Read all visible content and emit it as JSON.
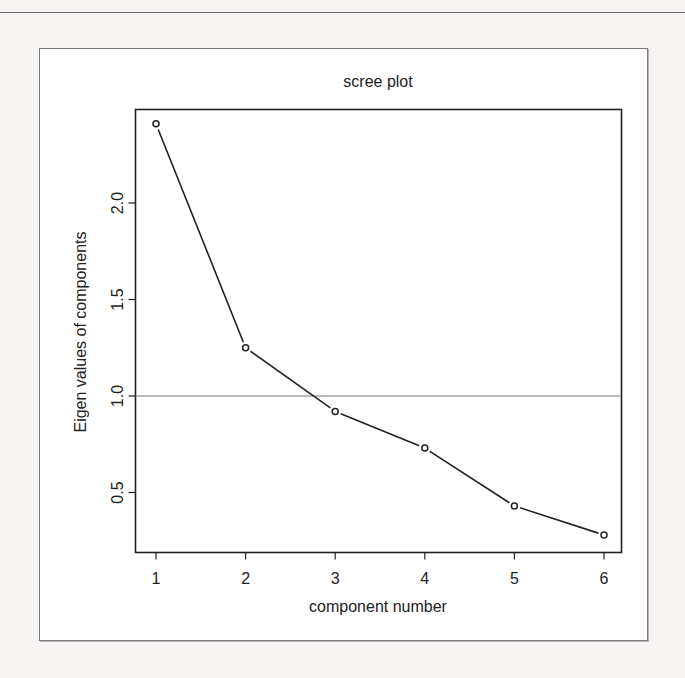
{
  "chart_data": {
    "type": "line",
    "title": "scree plot",
    "xlabel": "component number",
    "ylabel": "Eigen values of components",
    "x": [
      1,
      2,
      3,
      4,
      5,
      6
    ],
    "values": [
      2.41,
      1.25,
      0.92,
      0.73,
      0.43,
      0.28
    ],
    "series": [
      {
        "name": "eigenvalues",
        "values": [
          2.41,
          1.25,
          0.92,
          0.73,
          0.43,
          0.28
        ]
      }
    ],
    "xticks": [
      "1",
      "2",
      "3",
      "4",
      "5",
      "6"
    ],
    "yticks": [
      "0.5",
      "1.0",
      "1.5",
      "2.0"
    ],
    "ytick_values": [
      0.5,
      1.0,
      1.5,
      2.0
    ],
    "reference_line": {
      "y": 1.0,
      "orientation": "horizontal"
    },
    "marker": "open-circle",
    "xlim": [
      0.9,
      6.15
    ],
    "ylim": [
      0.2,
      2.5
    ],
    "grid": false,
    "legend": null
  },
  "colors": {
    "background": "#f8f3f3",
    "panel": "#ffffff",
    "line": "#222222",
    "reference_line": "#777777",
    "frame": "#7a7a7a"
  }
}
